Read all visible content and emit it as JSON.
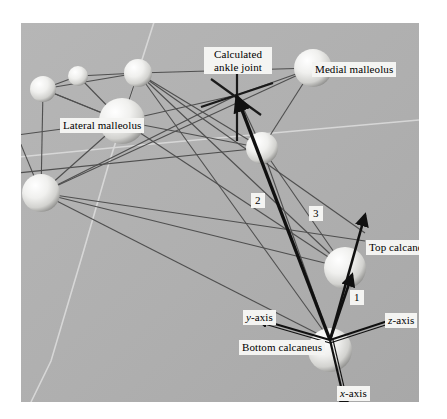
{
  "figure": {
    "background_color": "#ffffff",
    "scene_color": "#b0b0b0",
    "label_background": "#f4f4f2",
    "sphere_color": "#e8e8e6",
    "marker_line_color": "#4a4a4a"
  },
  "labels": {
    "calculated_ankle_joint": "Calculated ankle joint",
    "calculated_ankle_joint_line1": "Calculated",
    "calculated_ankle_joint_line2": "ankle joint",
    "medial_malleolus": "Medial malleolus",
    "lateral_malleolus": "Lateral malleolus",
    "top_calcaneus": "Top calcaneus",
    "bottom_calcaneus": "Bottom calcaneus",
    "segment_one": "1",
    "segment_two": "2",
    "segment_three": "3",
    "x_axis_prefix": "x",
    "x_axis_suffix": "-axis",
    "y_axis_prefix": "y",
    "y_axis_suffix": "-axis",
    "z_axis_prefix": "z",
    "z_axis_suffix": "-axis"
  },
  "markers": [
    {
      "name": "marker-upper-left-small",
      "cx": 22,
      "cy": 66,
      "r": 13
    },
    {
      "name": "marker-upper-mid-small",
      "cx": 57,
      "cy": 53,
      "r": 10
    },
    {
      "name": "marker-upper-right-small",
      "cx": 117,
      "cy": 50,
      "r": 14
    },
    {
      "name": "marker-lateral-malleolus",
      "cx": 101,
      "cy": 98,
      "r": 23
    },
    {
      "name": "marker-left-lower",
      "cx": 20,
      "cy": 170,
      "r": 19
    },
    {
      "name": "marker-mid-right",
      "cx": 241,
      "cy": 125,
      "r": 16
    },
    {
      "name": "marker-medial-malleolus",
      "cx": 292,
      "cy": 45,
      "r": 19
    },
    {
      "name": "marker-top-calcaneus",
      "cx": 324,
      "cy": 245,
      "r": 21
    },
    {
      "name": "marker-bottom-calcaneus",
      "cx": 309,
      "cy": 327,
      "r": 22
    }
  ],
  "axes": {
    "origin": {
      "x": 309,
      "y": 317
    },
    "x": {
      "dx": 16,
      "dy": 72
    },
    "y": {
      "dx": -74,
      "dy": -22
    },
    "z": {
      "dx": 72,
      "dy": -24
    }
  },
  "segments": {
    "one": {
      "from": {
        "x": 309,
        "y": 317
      },
      "to": {
        "x": 330,
        "y": 251
      }
    },
    "two": {
      "from": {
        "x": 309,
        "y": 317
      },
      "to": {
        "x": 216,
        "y": 72
      }
    },
    "three": {
      "from": {
        "x": 309,
        "y": 317
      },
      "to": {
        "x": 344,
        "y": 192
      }
    }
  },
  "ankle_joint_cross": {
    "x": 216,
    "y": 72
  }
}
